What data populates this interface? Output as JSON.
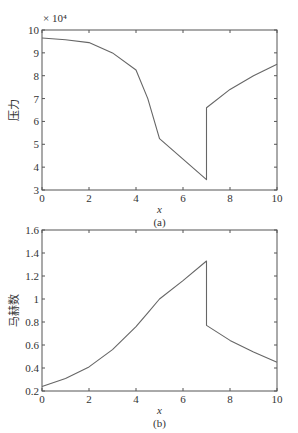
{
  "chart_data": [
    {
      "type": "line",
      "panel": "(a)",
      "title": "",
      "xlabel": "x",
      "ylabel": "压力",
      "y_multiplier": "× 10⁴",
      "xlim": [
        0,
        10
      ],
      "ylim": [
        3,
        10
      ],
      "xticks": [
        0,
        2,
        4,
        6,
        8,
        10
      ],
      "yticks": [
        3,
        4,
        5,
        6,
        7,
        8,
        9,
        10
      ],
      "grid": false,
      "series": [
        {
          "name": "pressure",
          "x": [
            0,
            1,
            2,
            3,
            4,
            4.5,
            5,
            6,
            7,
            7.0001,
            8,
            9,
            10
          ],
          "y": [
            9.65,
            9.57,
            9.45,
            9.0,
            8.25,
            7.0,
            5.25,
            4.35,
            3.45,
            6.6,
            7.4,
            8.0,
            8.5
          ]
        }
      ]
    },
    {
      "type": "line",
      "panel": "(b)",
      "title": "",
      "xlabel": "x",
      "ylabel": "马赫数",
      "xlim": [
        0,
        10
      ],
      "ylim": [
        0.2,
        1.6
      ],
      "xticks": [
        0,
        2,
        4,
        6,
        8,
        10
      ],
      "yticks": [
        0.2,
        0.4,
        0.6,
        0.8,
        1.0,
        1.2,
        1.4,
        1.6
      ],
      "grid": false,
      "series": [
        {
          "name": "mach",
          "x": [
            0,
            1,
            2,
            3,
            4,
            4.5,
            5,
            6,
            7,
            7.0001,
            8,
            9,
            10
          ],
          "y": [
            0.24,
            0.31,
            0.41,
            0.56,
            0.76,
            0.88,
            1.0,
            1.16,
            1.33,
            0.77,
            0.64,
            0.54,
            0.45
          ]
        }
      ]
    }
  ],
  "captions": {
    "a": "(a)",
    "b": "(b)"
  },
  "labels": {
    "top_ylabel": "压力",
    "bottom_ylabel": "马赫数",
    "xlabel": "x",
    "multiplier": "× 10⁴"
  }
}
